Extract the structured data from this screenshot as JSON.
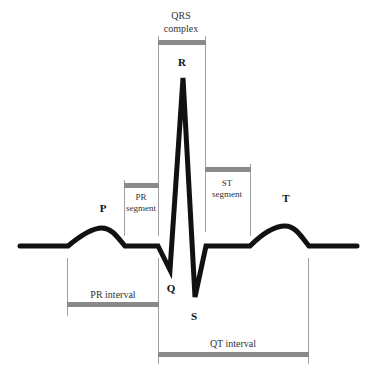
{
  "diagram": {
    "colors": {
      "waveform": "#111111",
      "guide_line": "#9a9a9a",
      "interval_bar": "#8a8a8a",
      "text": "#333333",
      "background": "#ffffff"
    },
    "wave_labels": {
      "p": "P",
      "q": "Q",
      "r": "R",
      "s": "S",
      "t": "T"
    },
    "segments": {
      "qrs_line1": "QRS",
      "qrs_line2": "complex",
      "pr_seg_line1": "PR",
      "pr_seg_line2": "segment",
      "st_seg_line1": "ST",
      "st_seg_line2": "segment",
      "pr_interval": "PR interval",
      "qt_interval": "QT interval"
    }
  }
}
